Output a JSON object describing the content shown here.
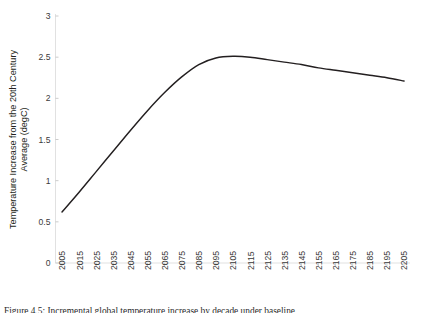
{
  "chart_data": {
    "type": "line",
    "title": "",
    "subtitle": "",
    "xlabel": "",
    "ylabel": "Temperature Increase from the 20th Century Average (degC)",
    "xlim": [
      2005,
      2205
    ],
    "ylim": [
      0,
      3
    ],
    "grid": false,
    "legend": false,
    "legend_position": "none",
    "line_color": "#231f20",
    "x_tick_labels": [
      "2005",
      "2015",
      "2025",
      "2035",
      "2045",
      "2055",
      "2065",
      "2075",
      "2085",
      "2095",
      "2105",
      "2115",
      "2125",
      "2135",
      "2145",
      "2155",
      "2165",
      "2175",
      "2185",
      "2195",
      "2205"
    ],
    "y_tick_labels": [
      "0",
      "0.5",
      "1",
      "1.5",
      "2",
      "2.5",
      "3"
    ],
    "y_ticks": [
      0,
      0.5,
      1,
      1.5,
      2,
      2.5,
      3
    ],
    "series": [
      {
        "name": "Temperature Increase",
        "x": [
          2005,
          2015,
          2025,
          2035,
          2045,
          2055,
          2065,
          2075,
          2085,
          2095,
          2105,
          2115,
          2125,
          2135,
          2145,
          2155,
          2165,
          2175,
          2185,
          2195,
          2205
        ],
        "values": [
          0.62,
          0.86,
          1.11,
          1.36,
          1.61,
          1.85,
          2.07,
          2.26,
          2.41,
          2.49,
          2.51,
          2.5,
          2.47,
          2.44,
          2.41,
          2.37,
          2.34,
          2.31,
          2.28,
          2.25,
          2.21
        ]
      }
    ],
    "annotations": []
  },
  "caption": {
    "text": "Figure 4.5: Incremental global temperature increase by decade under baseline"
  }
}
